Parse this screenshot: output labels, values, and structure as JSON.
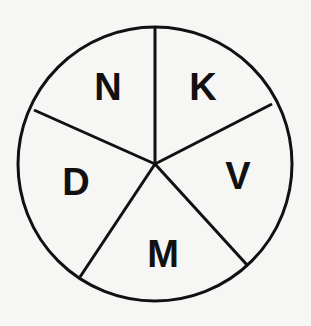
{
  "diagram": {
    "type": "circle divided into five sectors",
    "center": [
      155,
      164
    ],
    "radius": 138,
    "stroke_color": "#111111",
    "background": "#f6f6f4",
    "divider_endpoints": [
      [
        155,
        26
      ],
      [
        272,
        104
      ],
      [
        248,
        266
      ],
      [
        80,
        276
      ],
      [
        33,
        110
      ]
    ],
    "sectors": [
      {
        "label": "N",
        "x": 108,
        "y": 100
      },
      {
        "label": "K",
        "x": 203,
        "y": 100
      },
      {
        "label": "V",
        "x": 238,
        "y": 189
      },
      {
        "label": "M",
        "x": 163,
        "y": 267
      },
      {
        "label": "D",
        "x": 76,
        "y": 195
      }
    ]
  }
}
